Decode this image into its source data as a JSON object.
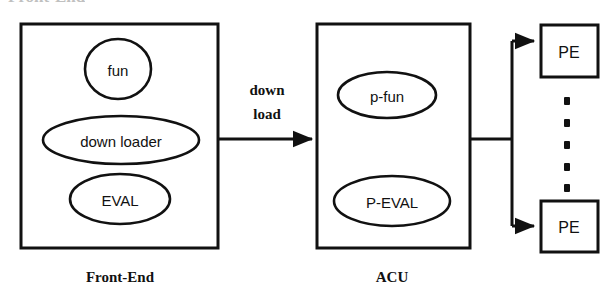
{
  "figure": {
    "type": "block-diagram",
    "cut_off_heading": "Front-End",
    "front_end_block": {
      "caption": "Front-End",
      "nodes": [
        {
          "id": "fun",
          "label": "fun",
          "shape": "circle"
        },
        {
          "id": "down-loader",
          "label": "down loader",
          "shape": "ellipse"
        },
        {
          "id": "eval",
          "label": "EVAL",
          "shape": "ellipse"
        }
      ]
    },
    "acu_block": {
      "caption": "ACU",
      "nodes": [
        {
          "id": "p-fun",
          "label": "p-fun",
          "shape": "ellipse"
        },
        {
          "id": "p-eval",
          "label": "P-EVAL",
          "shape": "ellipse"
        }
      ]
    },
    "pe_nodes": [
      {
        "id": "pe-top",
        "label": "PE",
        "shape": "rect"
      },
      {
        "id": "pe-bottom",
        "label": "PE",
        "shape": "rect"
      }
    ],
    "pe_continuation": {
      "glyph": "vertical-ellipsis",
      "dot_count": 5
    },
    "edges": [
      {
        "id": "download-edge",
        "from": "Front-End",
        "to": "ACU",
        "label_line1": "down",
        "label_line2": "load",
        "arrow": true
      },
      {
        "id": "acu-bus",
        "from": "ACU",
        "to": "PE bus",
        "arrow": false
      },
      {
        "id": "bus-pe-top",
        "from": "PE bus",
        "to": "PE",
        "arrow": true
      },
      {
        "id": "bus-pe-bottom",
        "from": "PE bus",
        "to": "PE",
        "arrow": true
      }
    ],
    "colors": {
      "stroke": "#111111",
      "background": "#ffffff",
      "text": "#111111"
    }
  }
}
